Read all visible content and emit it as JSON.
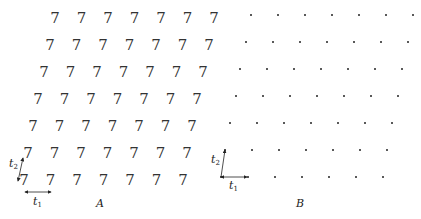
{
  "panels": {
    "A": {
      "label": "A",
      "glyph": "7",
      "rows": 7,
      "cols": 7,
      "row_start_x": [
        55,
        50,
        44,
        38,
        33,
        28,
        24
      ],
      "row_y": [
        18,
        45,
        72,
        99,
        126,
        153,
        180
      ],
      "spacing_x": 26.5,
      "vectors": {
        "t1": "t",
        "t1_sub": "1",
        "t2": "t",
        "t2_sub": "2"
      }
    },
    "B": {
      "label": "B",
      "rows": 7,
      "cols": 7,
      "row_start_x": [
        251,
        246,
        240,
        236,
        230,
        225,
        221
      ],
      "row_y": [
        15,
        42,
        69,
        96,
        123,
        150,
        177
      ],
      "spacing_x": 27,
      "vectors": {
        "t1": "t",
        "t1_sub": "1",
        "t2": "t",
        "t2_sub": "2"
      }
    }
  }
}
